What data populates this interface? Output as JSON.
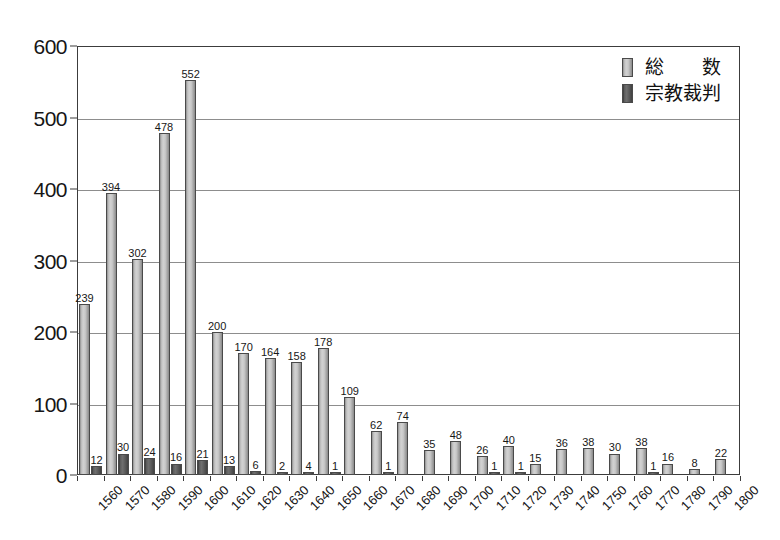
{
  "chart_data": {
    "type": "bar",
    "title": "",
    "subtitle": "",
    "xlabel": "",
    "ylabel": "",
    "ylim": [
      0,
      600
    ],
    "ytick_step": 100,
    "yticks": [
      "0",
      "100",
      "200",
      "300",
      "400",
      "500",
      "600"
    ],
    "grid": true,
    "legend_position": "top-right",
    "categories": [
      "1560",
      "1570",
      "1580",
      "1590",
      "1600",
      "1610",
      "1620",
      "1630",
      "1640",
      "1650",
      "1660",
      "1670",
      "1680",
      "1690",
      "1700",
      "1710",
      "1720",
      "1730",
      "1740",
      "1750",
      "1760",
      "1770",
      "1780",
      "1790",
      "1800"
    ],
    "series": [
      {
        "name": "総　　数",
        "key": "total",
        "color": "#c9c9c9",
        "values": [
          239,
          394,
          302,
          478,
          552,
          200,
          170,
          164,
          158,
          178,
          109,
          62,
          74,
          35,
          48,
          26,
          40,
          15,
          36,
          38,
          30,
          38,
          16,
          8,
          22
        ]
      },
      {
        "name": "宗教裁判",
        "key": "inquisition",
        "color": "#5a5a5a",
        "values": [
          12,
          30,
          24,
          16,
          21,
          13,
          6,
          2,
          4,
          1,
          0,
          1,
          0,
          0,
          0,
          1,
          1,
          0,
          0,
          0,
          0,
          1,
          0,
          0,
          0
        ]
      }
    ]
  },
  "legend": {
    "items": [
      {
        "label": "総　　数",
        "swatch": "total"
      },
      {
        "label": "宗教裁判",
        "swatch": "inquisition"
      }
    ]
  }
}
